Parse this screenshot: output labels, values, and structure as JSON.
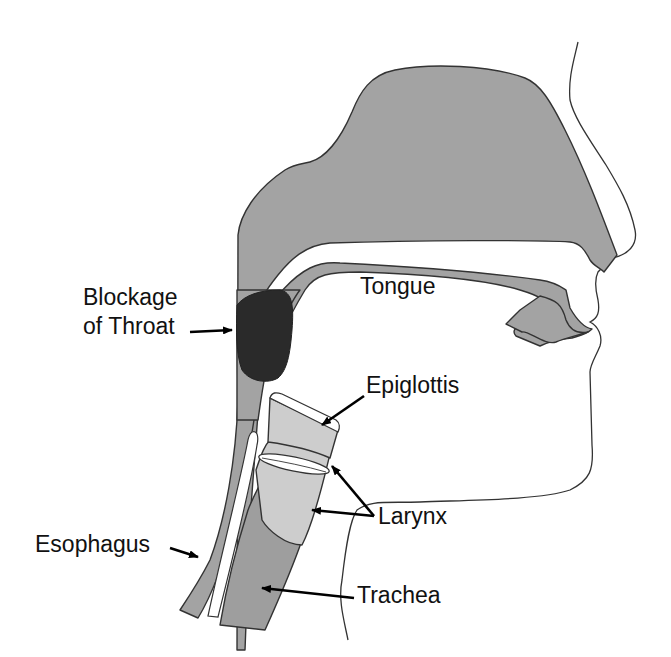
{
  "diagram": {
    "type": "anatomical cross-section of head and neck (throat obstruction)",
    "colors": {
      "tissue": "#a3a3a3",
      "tissue_dark": "#999999",
      "larynx": "#cccccc",
      "blockage": "#2a2a2a",
      "outline": "#333333",
      "background": "#ffffff"
    },
    "labels": {
      "tongue": "Tongue",
      "blockage_line1": "Blockage",
      "blockage_line2": "of Throat",
      "epiglottis": "Epiglottis",
      "larynx": "Larynx",
      "esophagus": "Esophagus",
      "trachea": "Trachea"
    }
  }
}
